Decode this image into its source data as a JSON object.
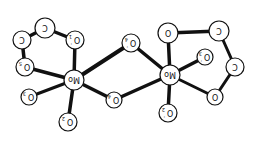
{
  "diagram": {
    "type": "molecular-structure",
    "orientation": "rotated-180",
    "colors": {
      "ink": "#111111",
      "background": "#ffffff",
      "atom_fill": "#ffffff"
    },
    "atoms": [
      {
        "id": "Mo_L",
        "label": "Mo",
        "sub": "",
        "prime": "",
        "x": 74,
        "y": 80,
        "r": 10
      },
      {
        "id": "Mo_R",
        "label": "Mo",
        "sub": "",
        "prime": "",
        "x": 170,
        "y": 75,
        "r": 10
      },
      {
        "id": "O1p",
        "label": "O",
        "sub": "1",
        "prime": "'",
        "x": 75,
        "y": 40,
        "r": 9
      },
      {
        "id": "C_L1",
        "label": "C",
        "sub": "",
        "prime": "",
        "x": 45,
        "y": 28,
        "r": 10
      },
      {
        "id": "C_L2",
        "label": "C",
        "sub": "",
        "prime": "",
        "x": 22,
        "y": 40,
        "r": 9
      },
      {
        "id": "O5",
        "label": "O",
        "sub": "5",
        "prime": "",
        "x": 25,
        "y": 67,
        "r": 9
      },
      {
        "id": "O3",
        "label": "O",
        "sub": "3",
        "prime": "",
        "x": 29,
        "y": 97,
        "r": 8
      },
      {
        "id": "O2",
        "label": "O",
        "sub": "2",
        "prime": "",
        "x": 68,
        "y": 122,
        "r": 9
      },
      {
        "id": "O4",
        "label": "O",
        "sub": "4",
        "prime": "",
        "x": 114,
        "y": 100,
        "r": 8
      },
      {
        "id": "O4p",
        "label": "O",
        "sub": "4",
        "prime": "'",
        "x": 131,
        "y": 43,
        "r": 9
      },
      {
        "id": "O_R1",
        "label": "O",
        "sub": "",
        "prime": "",
        "x": 168,
        "y": 33,
        "r": 10
      },
      {
        "id": "C_R1",
        "label": "C",
        "sub": "",
        "prime": "",
        "x": 219,
        "y": 31,
        "r": 10
      },
      {
        "id": "C_R2",
        "label": "C",
        "sub": "",
        "prime": "",
        "x": 235,
        "y": 67,
        "r": 9
      },
      {
        "id": "O_R2",
        "label": "O",
        "sub": "",
        "prime": "",
        "x": 215,
        "y": 97,
        "r": 8
      },
      {
        "id": "O3p",
        "label": "O",
        "sub": "3",
        "prime": "'",
        "x": 205,
        "y": 57,
        "r": 8
      },
      {
        "id": "O2p",
        "label": "O",
        "sub": "2",
        "prime": "'",
        "x": 168,
        "y": 113,
        "r": 9
      }
    ],
    "bonds": [
      {
        "from": "Mo_L",
        "to": "O1p",
        "w": 3.5
      },
      {
        "from": "Mo_L",
        "to": "O5",
        "w": 3.5
      },
      {
        "from": "Mo_L",
        "to": "O3",
        "w": 3
      },
      {
        "from": "Mo_L",
        "to": "O2",
        "w": 3.5
      },
      {
        "from": "Mo_L",
        "to": "O4",
        "w": 3.5
      },
      {
        "from": "Mo_L",
        "to": "O4p",
        "w": 4
      },
      {
        "from": "O1p",
        "to": "C_L1",
        "w": 3.5
      },
      {
        "from": "C_L1",
        "to": "C_L2",
        "w": 3.5
      },
      {
        "from": "C_L2",
        "to": "O5",
        "w": 3.5
      },
      {
        "from": "O4",
        "to": "Mo_R",
        "w": 3.5
      },
      {
        "from": "O4p",
        "to": "Mo_R",
        "w": 3.5
      },
      {
        "from": "Mo_R",
        "to": "O_R1",
        "w": 3.5
      },
      {
        "from": "Mo_R",
        "to": "O3p",
        "w": 3.5
      },
      {
        "from": "Mo_R",
        "to": "O_R2",
        "w": 3
      },
      {
        "from": "Mo_R",
        "to": "O2p",
        "w": 3.5
      },
      {
        "from": "O_R1",
        "to": "C_R1",
        "w": 3.5
      },
      {
        "from": "C_R1",
        "to": "C_R2",
        "w": 3
      },
      {
        "from": "C_R2",
        "to": "O_R2",
        "w": 3
      }
    ]
  }
}
